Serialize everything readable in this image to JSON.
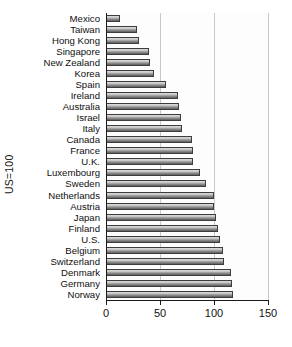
{
  "chart_data": {
    "type": "bar",
    "orientation": "horizontal",
    "title": "",
    "xlabel": "",
    "ylabel": "US=100",
    "xlim": [
      0,
      150
    ],
    "xticks": [
      0,
      50,
      100,
      150
    ],
    "xticklabels": [
      "0",
      "50",
      "100",
      "150"
    ],
    "grid": true,
    "grid_axis": "x",
    "legend": null,
    "bar_color": "#9a9a9a",
    "bar_edge_color": "#3d3d3d",
    "categories": [
      "Mexico",
      "Taiwan",
      "Hong Kong",
      "Singapore",
      "New Zealand",
      "Korea",
      "Spain",
      "Ireland",
      "Australia",
      "Israel",
      "Italy",
      "Canada",
      "France",
      "U.K.",
      "Luxembourg",
      "Sweden",
      "Netherlands",
      "Austria",
      "Japan",
      "Finland",
      "U.S.",
      "Belgium",
      "Switzerland",
      "Denmark",
      "Germany",
      "Norway"
    ],
    "values": [
      13,
      29,
      31,
      40,
      41,
      44,
      56,
      67,
      68,
      69,
      70,
      80,
      81,
      81,
      87,
      93,
      100,
      100,
      102,
      104,
      106,
      108,
      109,
      116,
      117,
      118
    ]
  }
}
